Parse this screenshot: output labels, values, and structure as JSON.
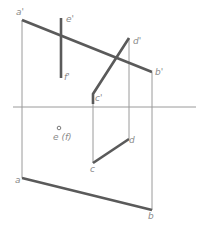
{
  "diagram": {
    "type": "orthographic-projection",
    "colors": {
      "thick_line": "#5a5a5a",
      "thin_line": "#9a9a9a",
      "label": "#8a8a8a"
    },
    "axis": {
      "y": 107,
      "x1": 13,
      "x2": 196
    },
    "points": {
      "a_prime": {
        "label": "a'",
        "x": 22,
        "y": 20
      },
      "b_prime": {
        "label": "b'",
        "x": 152,
        "y": 72
      },
      "c_prime": {
        "label": "c'",
        "x": 93,
        "y": 94
      },
      "d_prime": {
        "label": "d'",
        "x": 129,
        "y": 38
      },
      "e_prime": {
        "label": "e'",
        "x": 61,
        "y": 18
      },
      "f_prime": {
        "label": "f'",
        "x": 61,
        "y": 78
      },
      "a": {
        "label": "a",
        "x": 22,
        "y": 178
      },
      "b": {
        "label": "b",
        "x": 151,
        "y": 210
      },
      "c": {
        "label": "c",
        "x": 93,
        "y": 163
      },
      "d": {
        "label": "d",
        "x": 129,
        "y": 139
      },
      "ef": {
        "label": "e (f)",
        "x": 59,
        "y": 128
      }
    },
    "labels": {
      "a_prime": "a'",
      "b_prime": "b'",
      "c_prime": "c'",
      "d_prime": "d'",
      "e_prime": "e'",
      "f_prime": "f'",
      "a": "a",
      "b": "b",
      "c": "c",
      "d": "d",
      "ef": "e (f)"
    }
  }
}
